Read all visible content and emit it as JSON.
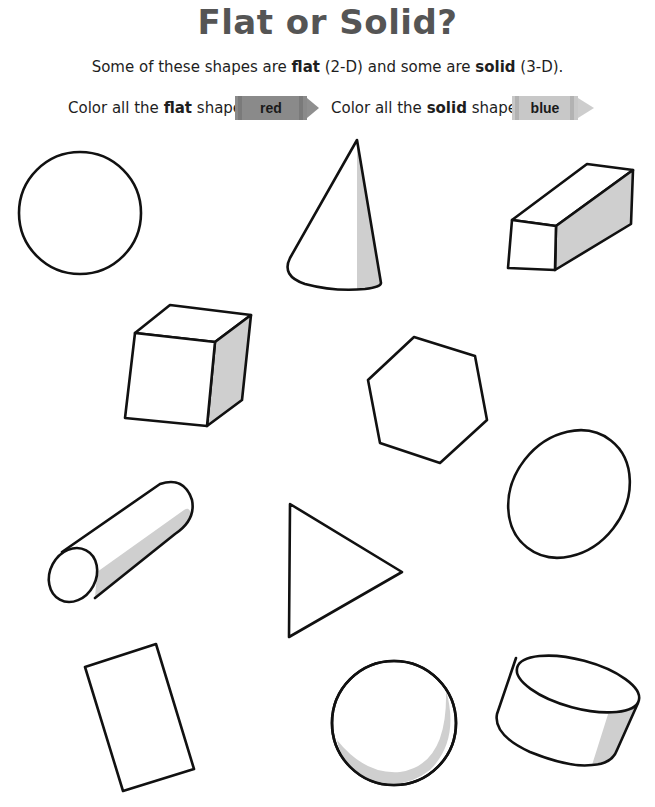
{
  "worksheet": {
    "title": "Flat or Solid?",
    "subtitle": {
      "part1": "Some of these shapes are ",
      "flat_word": "flat",
      "part2": " (2-D) and some are ",
      "solid_word": "solid",
      "part3": " (3-D)."
    },
    "instructions": [
      {
        "prefix": "Color all the ",
        "keyword": "flat",
        "suffix": " shapes",
        "crayon_label": "red",
        "crayon_color": "#8a8a8a",
        "crayon_band_color": "#7a7a7a",
        "crayon_tip_color": "#9a9a9a"
      },
      {
        "prefix": "Color all the ",
        "keyword": "solid",
        "suffix": " shapes",
        "crayon_label": "blue",
        "crayon_color": "#c4c4c4",
        "crayon_band_color": "#b0b0b0",
        "crayon_tip_color": "#cfcfcf"
      }
    ],
    "shapes": [
      {
        "name": "circle",
        "type": "flat"
      },
      {
        "name": "cone",
        "type": "solid"
      },
      {
        "name": "rectangular-prism",
        "type": "solid"
      },
      {
        "name": "cube",
        "type": "solid"
      },
      {
        "name": "hexagon",
        "type": "flat"
      },
      {
        "name": "oval",
        "type": "flat"
      },
      {
        "name": "cylinder-lying",
        "type": "solid"
      },
      {
        "name": "triangle",
        "type": "flat"
      },
      {
        "name": "rectangle",
        "type": "flat"
      },
      {
        "name": "sphere",
        "type": "solid"
      },
      {
        "name": "cylinder-tilted",
        "type": "solid"
      }
    ],
    "colors": {
      "outline": "#111111",
      "shading": "#cfcfcf",
      "title": "#555555"
    }
  }
}
